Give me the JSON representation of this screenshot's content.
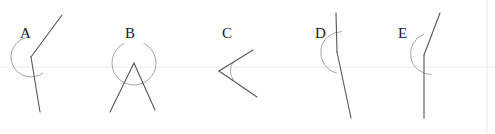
{
  "figure": {
    "name": "angle-identification-worksheet",
    "width": 495,
    "height": 134,
    "background_color": "#ffffff",
    "stroke_color": "#55555c",
    "arc_color": "#9a9aa2",
    "guide_color": "#e9e9ee",
    "label_color": "#1a1a1a"
  },
  "guides": {
    "horizontal_rule": {
      "x1": 0,
      "y1": 67,
      "x2": 495,
      "y2": 67
    },
    "vertical_rule": {
      "x1": 487,
      "y1": 0,
      "x2": 487,
      "y2": 134
    }
  },
  "angles": [
    {
      "label": "A",
      "label_x": 20,
      "label_y": 38,
      "vertex": {
        "x": 31,
        "y": 57
      },
      "ray1_end": {
        "x": 62,
        "y": 15
      },
      "ray2_end": {
        "x": 40,
        "y": 112
      },
      "arc": {
        "radius": 20,
        "start_deg": -53,
        "end_deg": 99,
        "sweep": 1,
        "large_arc": 1
      }
    },
    {
      "label": "B",
      "label_x": 125,
      "label_y": 38,
      "vertex": {
        "x": 134,
        "y": 63
      },
      "ray1_end": {
        "x": 110,
        "y": 112
      },
      "ray2_end": {
        "x": 155,
        "y": 110
      },
      "arc": {
        "radius": 22,
        "start_deg": 116,
        "end_deg": 64,
        "sweep": 0,
        "large_arc": 1
      }
    },
    {
      "label": "C",
      "label_x": 222,
      "label_y": 38,
      "vertex": {
        "x": 219,
        "y": 71
      },
      "ray1_end": {
        "x": 253,
        "y": 50
      },
      "ray2_end": {
        "x": 257,
        "y": 97
      },
      "arc": {
        "radius": 17,
        "start_deg": -32,
        "end_deg": 33,
        "sweep": 1,
        "large_arc": 0
      }
    },
    {
      "label": "D",
      "label_x": 315,
      "label_y": 38,
      "vertex": {
        "x": 337,
        "y": 52
      },
      "ray1_end": {
        "x": 336,
        "y": 13
      },
      "ray2_end": {
        "x": 351,
        "y": 118
      },
      "arc": {
        "radius": 21,
        "start_deg": 76,
        "end_deg": -91,
        "sweep": 0,
        "large_arc": 0
      }
    },
    {
      "label": "E",
      "label_x": 398,
      "label_y": 38,
      "vertex": {
        "x": 424,
        "y": 55
      },
      "ray1_end": {
        "x": 440,
        "y": 13
      },
      "ray2_end": {
        "x": 424,
        "y": 118
      },
      "arc": {
        "radius": 21,
        "start_deg": 90,
        "end_deg": -69,
        "sweep": 0,
        "large_arc": 0
      }
    }
  ],
  "chart_data": {
    "type": "diagram",
    "title": "",
    "items": [
      {
        "label": "A",
        "orientation": "vertex left-of-center, one ray up-right, one ray down",
        "arc_side": "right",
        "angle_kind": "reflex-marked obtuse"
      },
      {
        "label": "B",
        "orientation": "vertex at top, rays splay down-left and down-right",
        "arc_side": "above",
        "angle_kind": "reflex"
      },
      {
        "label": "C",
        "orientation": "vertex at left, rays open to the right",
        "arc_side": "interior right",
        "angle_kind": "acute"
      },
      {
        "label": "D",
        "orientation": "near-vertical line with slight bend at vertex",
        "arc_side": "left",
        "angle_kind": "straight/obtuse"
      },
      {
        "label": "E",
        "orientation": "vertical ray down, slanted ray up-right",
        "arc_side": "left",
        "angle_kind": "obtuse"
      }
    ]
  }
}
